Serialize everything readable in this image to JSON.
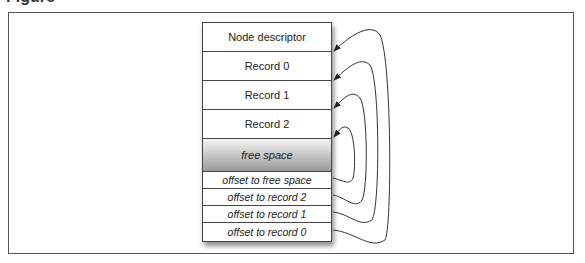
{
  "caption": {
    "text": "Figure"
  },
  "node": {
    "rows": [
      {
        "label": "Node descriptor",
        "kind": "header"
      },
      {
        "label": "Record 0",
        "kind": "record"
      },
      {
        "label": "Record 1",
        "kind": "record"
      },
      {
        "label": "Record 2",
        "kind": "record"
      },
      {
        "label": "free space",
        "kind": "free"
      },
      {
        "label": "offset to free space",
        "kind": "offset"
      },
      {
        "label": "offset to record 2",
        "kind": "offset"
      },
      {
        "label": "offset to record 1",
        "kind": "offset"
      },
      {
        "label": "offset to record 0",
        "kind": "offset"
      }
    ]
  },
  "arrows": [
    {
      "from": "offset to record 0",
      "to": "Record 0 (top)"
    },
    {
      "from": "offset to record 1",
      "to": "Record 1 (top)"
    },
    {
      "from": "offset to record 2",
      "to": "Record 2 (top)"
    },
    {
      "from": "offset to free space",
      "to": "free space (top)"
    }
  ],
  "colors": {
    "line": "#333333",
    "frame": "#555555",
    "free_top": "#f4f4f4",
    "free_bottom": "#9a9a9a"
  }
}
